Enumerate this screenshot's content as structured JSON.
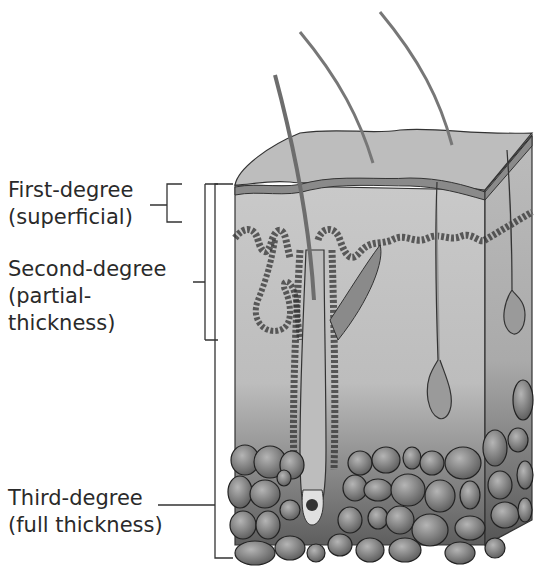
{
  "figure": {
    "labels": [
      {
        "id": "first",
        "line1": "First-degree",
        "line2": "(superficial)"
      },
      {
        "id": "second",
        "line1": "Second-degree",
        "line2": "(partial-",
        "line3": "thickness)"
      },
      {
        "id": "third",
        "line1": "Third-degree",
        "line2": "(full thickness)"
      }
    ],
    "colors": {
      "line": "#333333",
      "epidermis": "#b8b8b8",
      "dermis_top": "#c8c8c8",
      "dermis_bottom": "#6a6a6a",
      "fat": "#8c8c8c"
    }
  }
}
